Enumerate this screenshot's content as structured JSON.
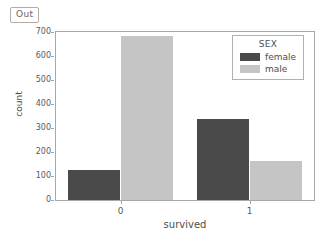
{
  "notebook": {
    "out_label": "Out"
  },
  "chart_data": {
    "type": "bar",
    "title": "",
    "xlabel": "survived",
    "ylabel": "count",
    "categories": [
      "0",
      "1"
    ],
    "series": [
      {
        "name": "female",
        "values": [
          127,
          339
        ],
        "color": "#4a4a4a"
      },
      {
        "name": "male",
        "values": [
          682,
          161
        ],
        "color": "#c5c5c5"
      }
    ],
    "legend": {
      "title": "SEX",
      "position": "upper right",
      "entries": [
        {
          "label": "female",
          "color": "#4a4a4a"
        },
        {
          "label": "male",
          "color": "#c5c5c5"
        }
      ]
    },
    "ylim": [
      0,
      700
    ],
    "yticks": [
      0,
      100,
      200,
      300,
      400,
      500,
      600,
      700
    ],
    "ytick_labels": [
      "0",
      "100",
      "200",
      "300",
      "400",
      "500",
      "600",
      "700"
    ],
    "xticks": [
      "0",
      "1"
    ],
    "grid": false,
    "frame": true
  }
}
